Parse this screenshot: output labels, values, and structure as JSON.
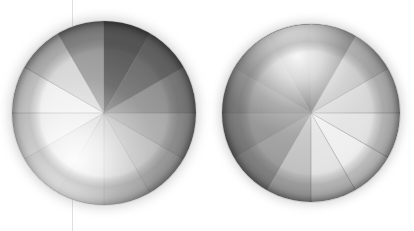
{
  "canvas": {
    "width": 414,
    "height": 231,
    "background": "#ffffff",
    "guide_line": {
      "x": 72,
      "color": "#d9d9d9",
      "orientation": "vertical"
    }
  },
  "chart_data": {
    "type": "pie",
    "title": "",
    "subtitle": "",
    "xlabel": "",
    "ylabel": "",
    "grid": false,
    "legend": "none",
    "annotations": [],
    "slice_count": 12,
    "slice_angle_deg": 30,
    "categories": [
      "S1",
      "S2",
      "S3",
      "S4",
      "S5",
      "S6",
      "S7",
      "S8",
      "S9",
      "S10",
      "S11",
      "S12"
    ],
    "values": [
      30,
      30,
      30,
      30,
      30,
      30,
      30,
      30,
      30,
      30,
      30,
      30
    ],
    "charts": [
      {
        "name": "sphere-left",
        "center": {
          "x": 104,
          "y": 113
        },
        "radius": 92,
        "start_angle_deg": 0,
        "highlight": {
          "x": 76,
          "y": 160,
          "radius": 86,
          "intensity": 0.95
        },
        "rim_shadow": "#7a7a7a",
        "slice_colors": [
          "#8f8f8f",
          "#6e6e6e",
          "#5d5d5d",
          "#9a9a9a",
          "#d5d5d5",
          "#eeeeee",
          "#e6e6e6",
          "#cfcfcf",
          "#c4c4c4",
          "#bdbdbd",
          "#b4b4b4",
          "#a6a6a6"
        ],
        "slice_labels": [
          "0°–30°",
          "330°–0°",
          "300°–330°",
          "270°–300°",
          "240°–270°",
          "210°–240°",
          "180°–210°",
          "150°–180°",
          "120°–150°",
          "90°–120°",
          "60°–90°",
          "30°–60°"
        ]
      },
      {
        "name": "sphere-right",
        "center": {
          "x": 311,
          "y": 113
        },
        "radius": 89,
        "start_angle_deg": 0,
        "highlight": {
          "x": 298,
          "y": 56,
          "radius": 82,
          "intensity": 0.95
        },
        "rim_shadow": "#6b6b6b",
        "slice_colors": [
          "#d3d3d3",
          "#b9b9b9",
          "#6a6a6a",
          "#5b5b5b",
          "#6d6d6d",
          "#7e7e7e",
          "#8c8c8c",
          "#9b9b9b",
          "#c2c2c2",
          "#e4e4e4",
          "#efefef",
          "#e2e2e2"
        ],
        "slice_labels": [
          "0°–30°",
          "330°–0°",
          "300°–330°",
          "270°–300°",
          "240°–270°",
          "210°–240°",
          "180°–210°",
          "150°–180°",
          "120°–150°",
          "90°–120°",
          "60°–90°",
          "30°–60°"
        ]
      }
    ],
    "divider_color": "#6b6b6b",
    "divider_width": 0.7
  }
}
